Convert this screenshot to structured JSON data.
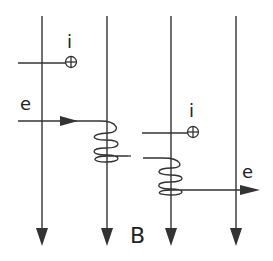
{
  "diagram": {
    "field_label": "B",
    "electron_label_in": "e",
    "electron_label_out": "e",
    "ion_label_1": "i",
    "ion_label_2": "i",
    "colors": {
      "stroke": "#333333",
      "text": "#222222",
      "background": "#ffffff"
    }
  }
}
